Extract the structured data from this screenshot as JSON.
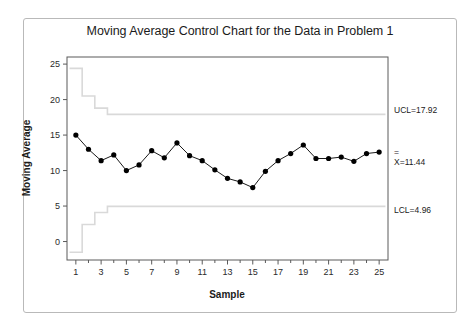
{
  "figure": {
    "title": "Moving Average Control Chart for the Data in Problem 1",
    "border_color": "#b9b9b9"
  },
  "annotations": {
    "ucl_label": "UCL=17.92",
    "center_overbar": "=",
    "center_label": "X=11.44",
    "lcl_label": "LCL=4.96"
  },
  "chart_data": {
    "type": "line",
    "title": "Moving Average Control Chart for the Data in Problem 1",
    "xlabel": "Sample",
    "ylabel": "Moving Average",
    "xlim": [
      0.3,
      25.7
    ],
    "ylim": [
      -2.6,
      26.0
    ],
    "grid": false,
    "legend": "none",
    "x_ticks": [
      1,
      3,
      5,
      7,
      9,
      11,
      13,
      15,
      17,
      19,
      21,
      23,
      25
    ],
    "x_minor_ticks": [
      2,
      4,
      6,
      8,
      10,
      12,
      14,
      16,
      18,
      20,
      22,
      24
    ],
    "y_ticks": [
      0,
      5,
      10,
      15,
      20,
      25
    ],
    "x": [
      1,
      2,
      3,
      4,
      5,
      6,
      7,
      8,
      9,
      10,
      11,
      12,
      13,
      14,
      15,
      16,
      17,
      18,
      19,
      20,
      21,
      22,
      23,
      24,
      25
    ],
    "series": [
      {
        "name": "Moving Average",
        "color": "#000000",
        "marker": "filled-circle",
        "values": [
          15.0,
          13.0,
          11.4,
          12.2,
          10.0,
          10.8,
          12.8,
          11.8,
          13.9,
          12.1,
          11.4,
          10.1,
          8.9,
          8.4,
          7.6,
          9.9,
          11.4,
          12.4,
          13.6,
          11.7,
          11.7,
          11.9,
          11.3,
          12.4,
          12.6
        ]
      }
    ],
    "control_limits": {
      "line_color": "#d9d9d9",
      "center_line": 11.44,
      "ucl_steady": 17.92,
      "lcl_steady": 4.96,
      "ucl_steps": [
        24.4,
        20.5,
        18.8,
        17.92,
        17.92,
        17.92,
        17.92,
        17.92,
        17.92,
        17.92,
        17.92,
        17.92,
        17.92,
        17.92,
        17.92,
        17.92,
        17.92,
        17.92,
        17.92,
        17.92,
        17.92,
        17.92,
        17.92,
        17.92,
        17.92
      ],
      "lcl_steps": [
        -1.5,
        2.4,
        4.1,
        4.96,
        4.96,
        4.96,
        4.96,
        4.96,
        4.96,
        4.96,
        4.96,
        4.96,
        4.96,
        4.96,
        4.96,
        4.96,
        4.96,
        4.96,
        4.96,
        4.96,
        4.96,
        4.96,
        4.96,
        4.96,
        4.96
      ]
    }
  }
}
